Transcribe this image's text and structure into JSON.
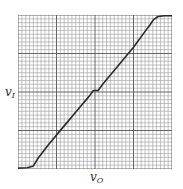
{
  "chart_data": {
    "type": "line",
    "title": "",
    "xlabel": "v_O",
    "ylabel": "v_I",
    "xlabel_main": "v",
    "xlabel_sub": "O",
    "ylabel_main": "v",
    "ylabel_sub": "I",
    "grid": true,
    "grid_divisions": 40,
    "major_every": 10,
    "xlim": [
      0,
      1
    ],
    "ylim": [
      0,
      1
    ],
    "tick_labels": [],
    "legend": [],
    "series": [
      {
        "name": "transfer characteristic",
        "x": [
          0.0,
          0.06,
          0.1,
          0.13,
          0.2,
          0.3,
          0.4,
          0.46,
          0.49,
          0.52,
          0.55,
          0.65,
          0.75,
          0.83,
          0.86,
          0.88,
          0.91,
          0.95,
          1.0
        ],
        "y": [
          0.006,
          0.008,
          0.02,
          0.07,
          0.16,
          0.28,
          0.4,
          0.47,
          0.51,
          0.51,
          0.55,
          0.67,
          0.79,
          0.9,
          0.94,
          0.97,
          0.99,
          0.995,
          0.995
        ]
      }
    ]
  },
  "colors": {
    "grid_minor": "#9a9a9a",
    "grid_major": "#555555",
    "curve": "#2a2a2a",
    "background": "#ffffff"
  }
}
